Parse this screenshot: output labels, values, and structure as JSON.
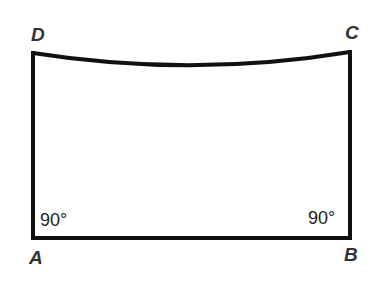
{
  "diagram": {
    "type": "quadrilateral",
    "stroke_color": "#111111",
    "text_color": "#333333",
    "vertices": [
      {
        "id": "A",
        "label": "A",
        "x": 33,
        "y": 238
      },
      {
        "id": "B",
        "label": "B",
        "x": 350,
        "y": 238
      },
      {
        "id": "C",
        "label": "C",
        "x": 350,
        "y": 52
      },
      {
        "id": "D",
        "label": "D",
        "x": 33,
        "y": 53
      }
    ],
    "edges": [
      {
        "from": "A",
        "to": "B",
        "kind": "straight"
      },
      {
        "from": "B",
        "to": "C",
        "kind": "straight"
      },
      {
        "from": "C",
        "to": "D",
        "kind": "curved",
        "sag_low_point_y": 65
      },
      {
        "from": "D",
        "to": "A",
        "kind": "straight"
      }
    ],
    "angles": [
      {
        "at": "A",
        "label": "90°"
      },
      {
        "at": "B",
        "label": "90°"
      }
    ]
  }
}
